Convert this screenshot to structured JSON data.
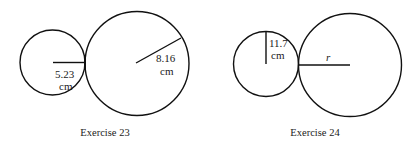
{
  "figures": [
    {
      "caption": "Exercise 23",
      "small_circle": {
        "radius_label_line1": "5.23",
        "radius_label_line2": "cm"
      },
      "large_circle": {
        "radius_label_line1": "8.16",
        "radius_label_line2": "cm"
      }
    },
    {
      "caption": "Exercise 24",
      "small_circle": {
        "radius_label_line1": "11.7",
        "radius_label_line2": "cm"
      },
      "large_circle": {
        "radius_label": "r"
      }
    }
  ],
  "colors": {
    "stroke": "#111111",
    "background": "#ffffff"
  }
}
